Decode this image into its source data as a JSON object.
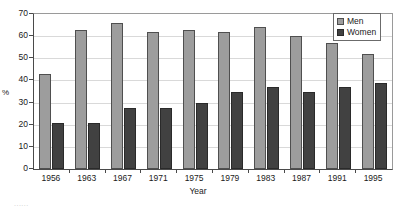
{
  "chart_data": {
    "type": "bar",
    "title": "",
    "xlabel": "Year",
    "ylabel": "%",
    "categories": [
      "1956",
      "1963",
      "1967",
      "1971",
      "1975",
      "1979",
      "1983",
      "1987",
      "1991",
      "1995"
    ],
    "series": [
      {
        "name": "Men",
        "color": "#9d9d9d",
        "values": [
          43,
          63,
          66,
          62,
          63,
          62,
          64,
          60,
          57,
          52
        ]
      },
      {
        "name": "Women",
        "color": "#414141",
        "values": [
          21,
          21,
          27.5,
          27.5,
          30,
          35,
          37,
          35,
          37,
          39
        ]
      }
    ],
    "ylim": [
      0,
      70
    ],
    "yticks": [
      0,
      10,
      20,
      30,
      40,
      50,
      60,
      70
    ],
    "ytick_labels": [
      "0",
      "10",
      "20",
      "30",
      "40",
      "50",
      "60",
      "70"
    ],
    "grid": true,
    "grid_axis": "y",
    "legend_position": "top-right"
  },
  "legend": {
    "entries": [
      {
        "label": "Men"
      },
      {
        "label": "Women"
      }
    ]
  },
  "axes": {
    "x_title": "Year",
    "y_title": "%"
  },
  "caption_fragment": "......"
}
